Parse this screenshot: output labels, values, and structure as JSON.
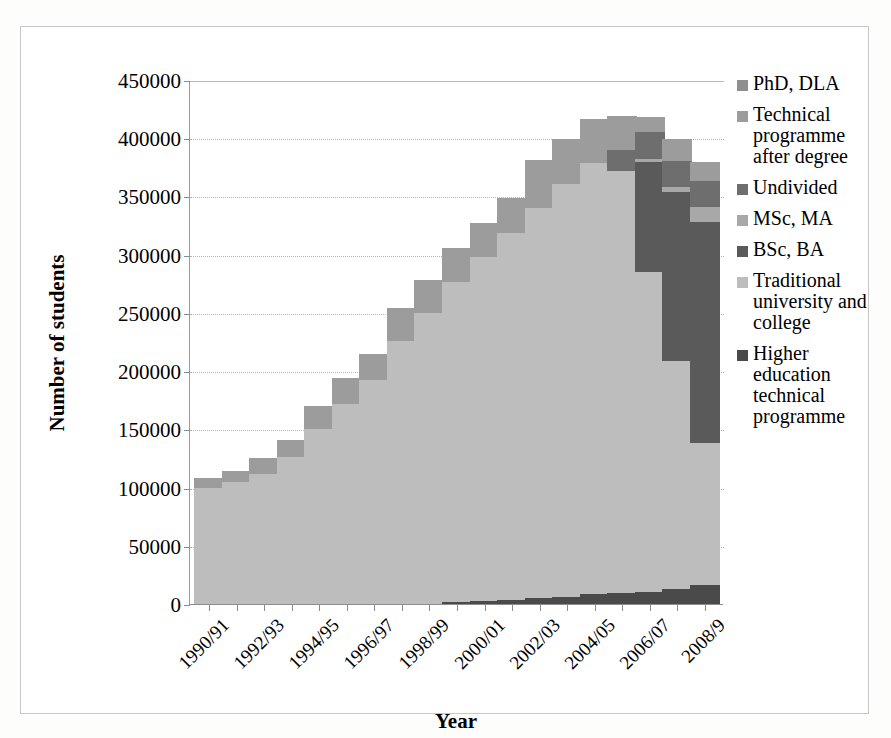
{
  "chart_data": {
    "type": "bar",
    "stacked": true,
    "title": "",
    "xlabel": "Year",
    "ylabel": "Number of students",
    "ylim": [
      0,
      450000
    ],
    "ytick_step": 50000,
    "ytick_labels": [
      "0",
      "50000",
      "100000",
      "150000",
      "200000",
      "250000",
      "300000",
      "350000",
      "400000",
      "450000"
    ],
    "grid": true,
    "grid_axis": "y",
    "legend_position": "right",
    "categories": [
      "1990/91",
      "1991/92",
      "1992/93",
      "1993/94",
      "1994/95",
      "1995/96",
      "1996/97",
      "1997/98",
      "1998/99",
      "1999/00",
      "2000/01",
      "2001/02",
      "2002/03",
      "2003/04",
      "2004/05",
      "2005/06",
      "2006/07",
      "2007/08",
      "2008/9"
    ],
    "xtick_labels_shown": [
      "1990/91",
      "1992/93",
      "1994/95",
      "1996/97",
      "1998/99",
      "2000/01",
      "2002/03",
      "2004/05",
      "2006/07",
      "2008/9"
    ],
    "series": [
      {
        "name": "Higher education technical programme",
        "color": "#4a4a4a",
        "values": [
          0,
          0,
          0,
          0,
          0,
          0,
          0,
          0,
          0,
          1500,
          3000,
          3500,
          5000,
          6000,
          8500,
          9500,
          10000,
          12500,
          16000
        ]
      },
      {
        "name": "Traditional university and college",
        "color": "#bdbdbd",
        "values": [
          100000,
          105000,
          112000,
          126000,
          150000,
          172000,
          192000,
          226000,
          250000,
          275000,
          295000,
          315000,
          335000,
          355000,
          370000,
          362000,
          275000,
          196000,
          122000
        ]
      },
      {
        "name": "BSc, BA",
        "color": "#5a5a5a",
        "values": [
          0,
          0,
          0,
          0,
          0,
          0,
          0,
          0,
          0,
          0,
          0,
          0,
          0,
          0,
          0,
          0,
          95000,
          145000,
          190000
        ]
      },
      {
        "name": "MSc, MA",
        "color": "#a8a8a8",
        "values": [
          0,
          0,
          0,
          0,
          0,
          0,
          0,
          0,
          0,
          0,
          0,
          0,
          0,
          0,
          0,
          0,
          2000,
          5000,
          13000
        ]
      },
      {
        "name": "Undivided",
        "color": "#6e6e6e",
        "values": [
          0,
          0,
          0,
          0,
          0,
          0,
          0,
          0,
          0,
          0,
          0,
          0,
          0,
          0,
          0,
          18000,
          23000,
          22000,
          22000
        ]
      },
      {
        "name": "Technical programme after degree",
        "color": "#9c9c9c",
        "values": [
          8000,
          9500,
          13500,
          15000,
          20000,
          22000,
          22500,
          28000,
          28500,
          29000,
          29000,
          30000,
          41000,
          38500,
          38000,
          30000,
          13000,
          19000,
          17000
        ]
      },
      {
        "name": "PhD, DLA",
        "color": "#8f8f8f",
        "values": [
          0,
          0,
          0,
          0,
          0,
          0,
          0,
          0,
          0,
          0,
          0,
          0,
          0,
          0,
          0,
          0,
          0,
          0,
          0
        ]
      }
    ],
    "totals": [
      108000,
      114500,
      125500,
      141000,
      170000,
      194000,
      214500,
      254000,
      278500,
      305500,
      327000,
      348500,
      381000,
      399500,
      416500,
      419500,
      418000,
      399500,
      380000
    ]
  },
  "axes": {
    "y_title": "Number of students",
    "x_title": "Year"
  },
  "legend": {
    "items": [
      {
        "label": "PhD, DLA",
        "color": "#8f8f8f"
      },
      {
        "label": "Technical programme after degree",
        "color": "#9c9c9c"
      },
      {
        "label": "Undivided",
        "color": "#6e6e6e"
      },
      {
        "label": "MSc, MA",
        "color": "#a8a8a8"
      },
      {
        "label": "BSc, BA",
        "color": "#5a5a5a"
      },
      {
        "label": "Traditional university and college",
        "color": "#bdbdbd"
      },
      {
        "label": "Higher education technical programme",
        "color": "#4a4a4a"
      }
    ]
  }
}
